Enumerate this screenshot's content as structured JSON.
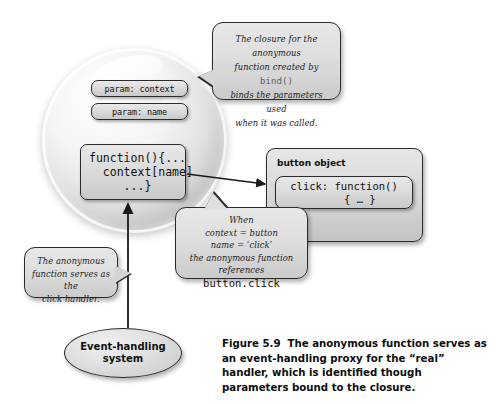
{
  "figure": {
    "number": "Figure 5.9",
    "caption": "The anonymous function serves as an event-handling proxy for the “real” handler, which is identified though parameters bound to the closure."
  },
  "closure_sphere": {
    "params": [
      {
        "label": "param: context"
      },
      {
        "label": "param: name"
      }
    ],
    "anonymous_function": "function(){...\n  context[name]\n     ...}"
  },
  "button_object": {
    "title": "button object",
    "click_property": "click: function()\n     { … }"
  },
  "bubbles": {
    "closure": {
      "line1": "The closure for the anonymous",
      "line2_a": "function created by ",
      "line2_code": "bind()",
      "line3": "binds the parameters used",
      "line4": "when it was called."
    },
    "when": {
      "line1": "When",
      "line2": "context = button",
      "line3": "name = ‘click’",
      "line4": "the anonymous function references",
      "line5_code": "button.click"
    },
    "handler": {
      "line1": "The anonymous",
      "line2": "function serves as the",
      "line3": "click handler."
    }
  },
  "event_system": {
    "label": "Event-handling system"
  },
  "colors": {
    "box_border": "#2b2b2b",
    "box_fill": "#dcdcdc",
    "arrow": "#1a1a1a",
    "background": "#ffffff"
  }
}
